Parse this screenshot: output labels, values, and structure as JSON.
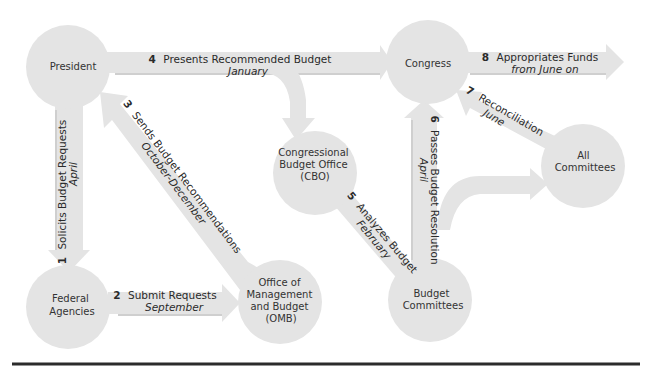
{
  "nodes": {
    "president": "President",
    "congress": "Congress",
    "cbo": [
      "Congressional",
      "Budget Office",
      "(CBO)"
    ],
    "all_committees": [
      "All",
      "Committees"
    ],
    "federal_agencies": [
      "Federal",
      "Agencies"
    ],
    "omb": [
      "Office of",
      "Management",
      "and Budget",
      "(OMB)"
    ],
    "budget_committees": [
      "Budget",
      "Committees"
    ]
  },
  "steps": [
    {
      "num": "1",
      "action": "Solicits Budget Requests",
      "when": "April",
      "from": "President",
      "to": "Federal Agencies"
    },
    {
      "num": "2",
      "action": "Submit Requests",
      "when": "September",
      "from": "Federal Agencies",
      "to": "Office of Management and Budget (OMB)"
    },
    {
      "num": "3",
      "action": "Sends Budget Recommendations",
      "when": "October-December",
      "from": "Office of Management and Budget (OMB)",
      "to": "President"
    },
    {
      "num": "4",
      "action": "Presents Recommended Budget",
      "when": "January",
      "from": "President",
      "to": "Congress"
    },
    {
      "num": "5",
      "action": "Analyzes Budget",
      "when": "February",
      "from": "Congressional Budget Office (CBO)",
      "to": "Budget Committees"
    },
    {
      "num": "6",
      "action": "Passes Budget Resolution",
      "when": "April",
      "from": "Budget Committees",
      "to": "Congress"
    },
    {
      "num": "7",
      "action": "Reconciliation",
      "when": "June",
      "from": "All Committees",
      "to": "Congress"
    },
    {
      "num": "8",
      "action": "Appropriates Funds",
      "when": "from June on",
      "from": "Congress",
      "to": "(out)"
    }
  ],
  "colors": {
    "shape_fill": "#e4e4e4",
    "text": "#2a2a2a",
    "rule": "#2b2b2b"
  }
}
